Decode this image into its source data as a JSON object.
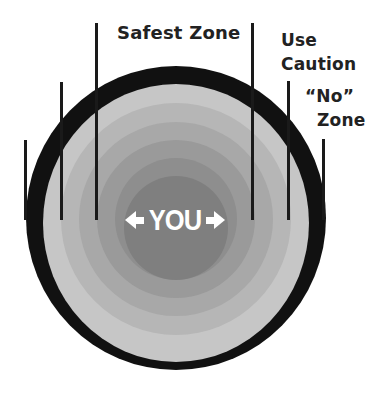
{
  "labels": {
    "safest": "Safest Zone",
    "caution_1": "Use",
    "caution_2": "Caution",
    "no_1": "“No”",
    "no_2": "Zone",
    "center": "YOU"
  },
  "colors": {
    "outer_ring": "#111111",
    "ring_1": "#c6c6c6",
    "ring_2": "#b6b6b6",
    "ring_3": "#a8a8a8",
    "ring_4": "#9a9a9a",
    "ring_5": "#8e8e8e",
    "center": "#7f7f7f",
    "lines": "#1a1a1a",
    "text": "#222222"
  },
  "icons": {
    "left_arrow": "arrow-left-icon",
    "right_arrow": "arrow-right-icon"
  }
}
